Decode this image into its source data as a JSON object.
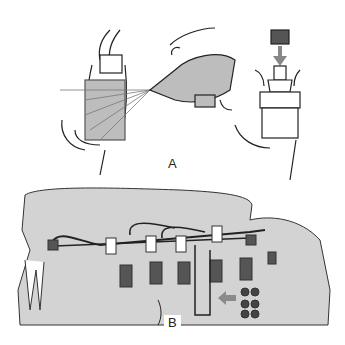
{
  "figure": {
    "panels": [
      {
        "id": "A",
        "label": "A",
        "description": "Loosening an injector pipe union while spraying with an aerosol; fitting a cap over an injector nozzle thread"
      },
      {
        "id": "B",
        "label": "B",
        "description": "Engine view showing injector pipe assembly with clamps, injectors and injection pump outlet (arrow)"
      }
    ],
    "colors": {
      "background": "#ffffff",
      "engine_fill": "#cfcfcf",
      "line": "#222222",
      "arrow": "#8a8a8a"
    }
  }
}
